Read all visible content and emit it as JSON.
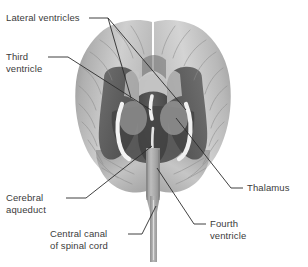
{
  "figure": {
    "background_color": "#ffffff",
    "label_color": "#3b3b3b",
    "leader_line_color": "#2b2b2b",
    "copyright": "© Cengage Learning 2009"
  },
  "labels": {
    "lateral_ventricles": "Lateral ventricles",
    "third_ventricle_line1": "Third",
    "third_ventricle_line2": "ventricle",
    "cerebral_aqueduct_line1": "Cerebral",
    "cerebral_aqueduct_line2": "aqueduct",
    "central_canal_line1": "Central canal",
    "central_canal_line2": "of spinal cord",
    "thalamus": "Thalamus",
    "fourth_ventricle_line1": "Fourth",
    "fourth_ventricle_line2": "ventricle"
  },
  "anatomy": {
    "cerebrum_fill_light": "#d2d2d2",
    "cerebrum_fill_mid": "#b4b4b4",
    "cerebrum_fill_dark": "#9a9a9a",
    "ventricle_cavity_dark": "#4e4e4e",
    "ventricle_cavity_mid": "#6a6a6a",
    "ventricle_highlight": "#f2f2f2",
    "brainstem_fill": "#a8a8a8",
    "sulci_stroke": "#8a8a8a"
  }
}
